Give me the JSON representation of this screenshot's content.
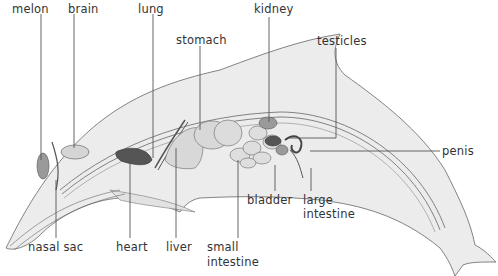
{
  "diagram": {
    "labels": {
      "melon": "melon",
      "brain": "brain",
      "lung": "lung",
      "stomach": "stomach",
      "kidney": "kidney",
      "testicles": "testicles",
      "penis": "penis",
      "nasal_sac": "nasal sac",
      "heart": "heart",
      "liver": "liver",
      "small_intestine_1": "small",
      "small_intestine_2": "intestine",
      "bladder": "bladder",
      "large_intestine_1": "large",
      "large_intestine_2": "intestine"
    },
    "colors": {
      "body_fill": "#ececec",
      "outline": "#555555",
      "organ_fill": "#dcdcdc",
      "dark_organ": "#555555",
      "mid_organ": "#9a9a9a",
      "leader_line": "#555555",
      "text": "#333333"
    }
  }
}
